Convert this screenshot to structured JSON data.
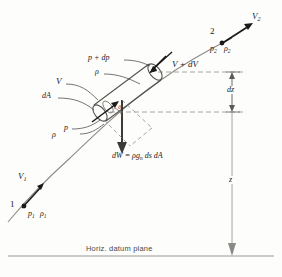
{
  "figure": {
    "datum_label": "Horiz. datum plane",
    "colors": {
      "ink": "#1a1a1a",
      "streamline": "#8a8a86",
      "dashed": "#8e8e8a",
      "element": "#55534f",
      "datum": "#9a9a95",
      "background": "#fdfdfb"
    }
  },
  "points": {
    "one": {
      "index": "1",
      "velocity": "V",
      "velocity_sub": "1",
      "pressure": "p",
      "pressure_sub": "1",
      "density": "ρ",
      "density_sub": "1"
    },
    "two": {
      "index": "2",
      "velocity": "V",
      "velocity_sub": "2",
      "pressure": "p",
      "pressure_sub": "2",
      "density": "ρ",
      "density_sub": "2"
    }
  },
  "element_labels": {
    "pressure_upper": "p + dp",
    "density_upper": "ρ",
    "velocity": "V",
    "area": "dA",
    "pressure_lower": "p",
    "density_lower": "ρ",
    "velocity_out": "V + dV",
    "theta": "θ"
  },
  "weight": {
    "equation": "dW = ρg",
    "equation_sub": "n",
    "equation_tail": " ds dA"
  },
  "dimensions": {
    "dz": "dz",
    "z": "z"
  }
}
